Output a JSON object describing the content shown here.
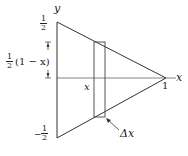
{
  "diagram": {
    "axis_labels": {
      "y": "y",
      "x": "x"
    },
    "ticks": {
      "top": {
        "num": "1",
        "den": "2",
        "sign": ""
      },
      "bottom": {
        "num": "1",
        "den": "2",
        "sign": "−"
      },
      "right": "1"
    },
    "height_label": {
      "coef_num": "1",
      "coef_den": "2",
      "expr": "(1 − x)"
    },
    "slice_x_label": "x",
    "width_label": "Δx",
    "colors": {
      "stroke": "#333333",
      "axis": "#555555"
    }
  }
}
